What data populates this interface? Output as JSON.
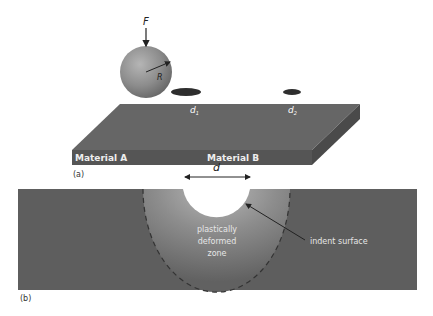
{
  "panel_a": {
    "force_label": "F",
    "radius_label": "R",
    "material_a_label": "Material A",
    "material_b_label": "Material B",
    "d1_label": "d",
    "d1_sub": "1",
    "d2_label": "d",
    "d2_sub": "2",
    "caption": "(a)"
  },
  "panel_b": {
    "diameter_label": "d",
    "zone_line1": "plastically",
    "zone_line2": "deformed",
    "zone_line3": "zone",
    "indent_label": "indent surface",
    "caption": "(b)"
  },
  "colors": {
    "slab": "#5e5e5e",
    "slab_side": "#4e4e4e",
    "sphere": "#8a8a8a",
    "text_light": "#e6e6e6"
  }
}
